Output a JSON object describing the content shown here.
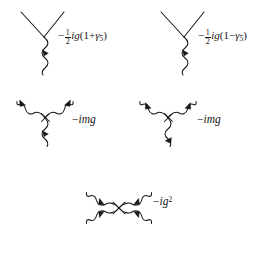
{
  "figure": {
    "background_color": "#ffffff",
    "ink_color": "#171717"
  },
  "panels": [
    {
      "id": "panel-top-left",
      "diagram": "fermion-fermion-boson-vertex",
      "label": {
        "minus": "−",
        "numerator": "1",
        "denominator": "2",
        "factor": "ig",
        "open_paren": "(",
        "sign": "+",
        "gamma": "γ",
        "gamma_index": "5",
        "close_paren": ")",
        "plain_text": "−½ig(1+γ₅)"
      }
    },
    {
      "id": "panel-top-right",
      "diagram": "fermion-fermion-boson-vertex",
      "label": {
        "minus": "−",
        "numerator": "1",
        "denominator": "2",
        "factor": "ig",
        "open_paren": "(",
        "sign": "−",
        "gamma": "γ",
        "gamma_index": "5",
        "close_paren": ")",
        "plain_text": "−½ig(1−γ₅)"
      }
    },
    {
      "id": "panel-middle-left",
      "diagram": "three-boson-vertex-outgoing",
      "label": {
        "plain_text": "−img",
        "minus": "−",
        "body": "img"
      }
    },
    {
      "id": "panel-middle-right",
      "diagram": "three-boson-vertex-incoming",
      "label": {
        "plain_text": "−img",
        "minus": "−",
        "body": "img"
      }
    },
    {
      "id": "panel-bottom",
      "diagram": "four-boson-vertex",
      "label": {
        "plain_text": "−ig²",
        "minus": "−",
        "body": "ig",
        "exponent": "2"
      }
    }
  ],
  "one": "1",
  "vertex_labels": {
    "top_left_one": "1",
    "top_right_one": "1"
  }
}
